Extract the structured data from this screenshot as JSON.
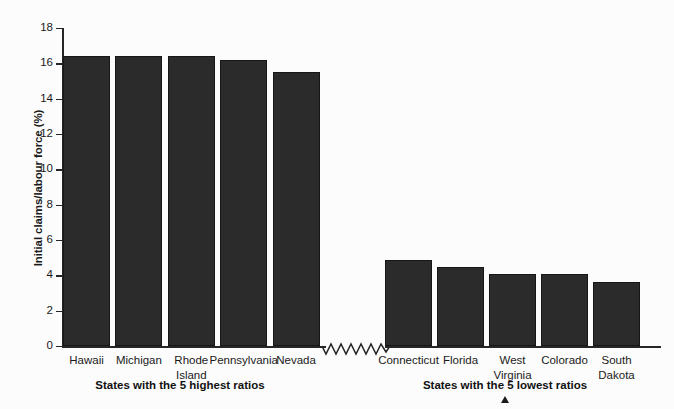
{
  "chart_data": {
    "type": "bar",
    "title": "",
    "xlabel": "",
    "ylabel": "Initial claims/labour force (%)",
    "ylim": [
      0,
      18
    ],
    "yticks": [
      0,
      2,
      4,
      6,
      8,
      10,
      12,
      14,
      16,
      18
    ],
    "grid": false,
    "legend": "none",
    "axis_break": true,
    "groups": [
      {
        "caption": "States with the 5 highest ratios",
        "categories": [
          "Hawaii",
          "Michigan",
          "Rhode\nIsland",
          "Pennsylvania",
          "Nevada"
        ],
        "values": [
          16.4,
          16.4,
          16.4,
          16.2,
          15.5
        ]
      },
      {
        "caption": "States with the 5 lowest ratios",
        "categories": [
          "Connecticut",
          "Florida",
          "West\nVirginia",
          "Colorado",
          "South\nDakota"
        ],
        "values": [
          4.85,
          4.5,
          4.05,
          4.05,
          3.6
        ]
      }
    ],
    "categories": [
      "Hawaii",
      "Michigan",
      "Rhode Island",
      "Pennsylvania",
      "Nevada",
      "Connecticut",
      "Florida",
      "West Virginia",
      "Colorado",
      "South Dakota"
    ],
    "values": [
      16.4,
      16.4,
      16.4,
      16.2,
      15.5,
      4.85,
      4.5,
      4.05,
      4.05,
      3.6
    ],
    "bar_color": "#2b2b2b"
  },
  "annotations": {
    "caret_marker": "▲"
  }
}
